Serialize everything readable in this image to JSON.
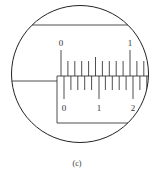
{
  "figure": {
    "caption": "(c)",
    "upper_scale": {
      "labels": [
        "0",
        "1"
      ],
      "divisions": 10
    },
    "lower_scale": {
      "labels": [
        "0",
        "1",
        "2"
      ],
      "divisions": 20
    }
  }
}
